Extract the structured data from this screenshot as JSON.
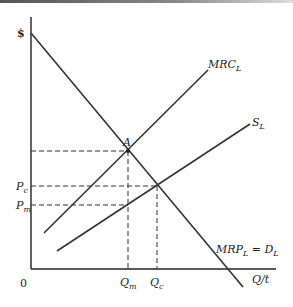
{
  "diagram": {
    "type": "economics-monopsony-labor-market",
    "y_axis_label": "$",
    "x_axis_label": "Q/t",
    "origin_label": "0",
    "curves": [
      {
        "id": "mrp",
        "label_main": "MRP",
        "label_sub": "L",
        "label_eq": " = D",
        "label_eq_sub": "L"
      },
      {
        "id": "mrc",
        "label_main": "MRC",
        "label_sub": "L"
      },
      {
        "id": "supply",
        "label_main": "S",
        "label_sub": "L"
      }
    ],
    "points": {
      "A": "A"
    },
    "price_labels": {
      "pc_main": "P",
      "pc_sub": "c",
      "pm_main": "P",
      "pm_sub": "m"
    },
    "quantity_labels": {
      "qm_main": "Q",
      "qm_sub": "m",
      "qc_main": "Q",
      "qc_sub": "c"
    }
  }
}
